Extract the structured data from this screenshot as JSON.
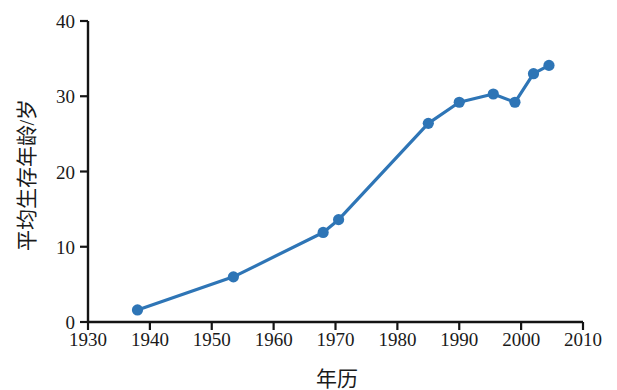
{
  "chart_data": {
    "type": "line",
    "title": "",
    "xlabel": "年历",
    "ylabel": "平均生存年龄/岁",
    "xlim": [
      1930,
      2010
    ],
    "ylim": [
      0,
      40
    ],
    "xticks": [
      1930,
      1940,
      1950,
      1960,
      1970,
      1980,
      1990,
      2000,
      2010
    ],
    "xtick_labels": [
      "1930",
      "1940",
      "1950",
      "1960",
      "1970",
      "1980",
      "1990",
      "2000",
      "2010"
    ],
    "yticks": [
      0,
      10,
      20,
      30,
      40
    ],
    "ytick_labels": [
      "0",
      "10",
      "20",
      "30",
      "40"
    ],
    "grid": false,
    "legend": null,
    "series": [
      {
        "name": "平均生存年龄",
        "color": "#2E75B6",
        "marker": "circle",
        "x": [
          1938,
          1953.5,
          1968,
          1970.5,
          1985,
          1990,
          1995.5,
          1999,
          2002,
          2004.5
        ],
        "y": [
          1.6,
          6.0,
          11.9,
          13.6,
          26.4,
          29.2,
          30.3,
          29.2,
          33.0,
          34.1
        ]
      }
    ]
  },
  "style": {
    "axis_color": "#141414",
    "line_color": "#2E75B6",
    "marker_color": "#2E75B6",
    "background": "#ffffff",
    "tick_label_color": "#1a1a1a"
  }
}
